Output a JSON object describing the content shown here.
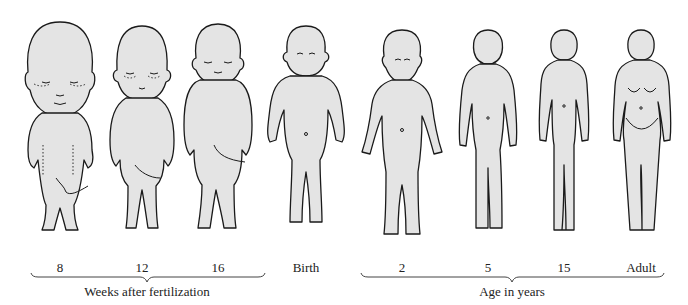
{
  "diagram": {
    "figures": [
      {
        "id": "week-8",
        "label": "8",
        "stage": "fetus",
        "cx": 60
      },
      {
        "id": "week-12",
        "label": "12",
        "stage": "fetus",
        "cx": 142
      },
      {
        "id": "week-16",
        "label": "16",
        "stage": "fetus",
        "cx": 218
      },
      {
        "id": "birth",
        "label": "Birth",
        "stage": "newborn",
        "cx": 306
      },
      {
        "id": "age-2",
        "label": "2",
        "stage": "child",
        "cx": 402
      },
      {
        "id": "age-5",
        "label": "5",
        "stage": "child",
        "cx": 488
      },
      {
        "id": "age-15",
        "label": "15",
        "stage": "adolescent",
        "cx": 564
      },
      {
        "id": "adult",
        "label": "Adult",
        "stage": "adult",
        "cx": 641
      }
    ],
    "groups": [
      {
        "id": "prenatal",
        "label": "Weeks after fertilization",
        "x1": 30,
        "x2": 265
      },
      {
        "id": "postnatal",
        "label": "Age in years",
        "x1": 360,
        "x2": 665
      }
    ],
    "colors": {
      "fill": "#e4e4e4",
      "outline": "#1a1a1a",
      "text": "#222222"
    }
  }
}
